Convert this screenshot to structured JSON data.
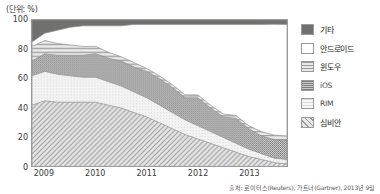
{
  "unit_label": "(단위: %)",
  "source_note": "출처: 로이터스(Reuters), 가트너(Gartner), 2013년 9월",
  "legend": {
    "items": [
      {
        "label": "기타",
        "swatch": "solid-dark-gray-swatch",
        "color": "#70706f"
      },
      {
        "label": "안드로이드",
        "swatch": "white-empty-swatch",
        "color": "#ffffff"
      },
      {
        "label": "윈도우",
        "swatch": "horizontal-lines-swatch",
        "color": "#c9c9c9"
      },
      {
        "label": "iOS",
        "swatch": "dense-dot-gray-swatch",
        "color": "#a3a3a3"
      },
      {
        "label": "RIM",
        "swatch": "light-dot-swatch",
        "color": "#efefef"
      },
      {
        "label": "심비안",
        "swatch": "diagonal-hatch-swatch",
        "color": "#cfcfcf"
      }
    ]
  },
  "chart_data": {
    "type": "area",
    "title": "",
    "xlabel": "",
    "ylabel": "",
    "unit": "%",
    "stacked": true,
    "normalized": true,
    "grid": true,
    "legend_position": "right",
    "ylim": [
      0,
      100
    ],
    "yticks": [
      0,
      20,
      40,
      60,
      80,
      100
    ],
    "xticks": [
      "2009",
      "2010",
      "2011",
      "2012",
      "2013"
    ],
    "xlim": [
      2008.75,
      2013.75
    ],
    "x": [
      2008.75,
      2009.0,
      2009.25,
      2009.5,
      2009.75,
      2010.0,
      2010.25,
      2010.5,
      2010.75,
      2011.0,
      2011.25,
      2011.5,
      2011.75,
      2012.0,
      2012.25,
      2012.5,
      2012.75,
      2013.0,
      2013.25,
      2013.5,
      2013.75
    ],
    "series": [
      {
        "name": "심비안",
        "stack_order": 1,
        "pattern": "diagonal-hatch",
        "color": "#cfcfcf",
        "values": [
          42,
          45,
          44,
          44,
          44,
          44,
          42,
          40,
          37,
          34,
          30,
          26,
          22,
          19,
          16,
          13,
          10,
          7,
          5,
          3,
          2
        ]
      },
      {
        "name": "RIM",
        "stack_order": 2,
        "pattern": "light-dots",
        "color": "#efefef",
        "values": [
          20,
          20,
          19,
          18,
          17,
          17,
          16,
          15,
          14,
          13,
          12,
          11,
          10,
          9,
          8,
          7,
          6,
          5,
          4,
          3,
          3
        ]
      },
      {
        "name": "iOS",
        "stack_order": 3,
        "pattern": "dense-dots",
        "color": "#a3a3a3",
        "values": [
          10,
          12,
          13,
          14,
          15,
          16,
          16,
          17,
          17,
          18,
          18,
          17,
          15,
          19,
          16,
          14,
          17,
          14,
          12,
          13,
          13
        ]
      },
      {
        "name": "윈도우",
        "stack_order": 4,
        "pattern": "horizontal-lines",
        "color": "#c9c9c9",
        "values": [
          10,
          9,
          8,
          7,
          6,
          5,
          4,
          3,
          3,
          2,
          2,
          2,
          2,
          2,
          2,
          2,
          2,
          2,
          3,
          3,
          3
        ]
      },
      {
        "name": "안드로이드",
        "stack_order": 5,
        "pattern": "none",
        "color": "#ffffff",
        "values": [
          3,
          5,
          9,
          12,
          14,
          14,
          18,
          21,
          26,
          30,
          35,
          41,
          48,
          48,
          55,
          61,
          62,
          69,
          73,
          77,
          76
        ]
      },
      {
        "name": "기타",
        "stack_order": 6,
        "pattern": "solid",
        "color": "#70706f",
        "values": [
          15,
          9,
          7,
          5,
          4,
          4,
          4,
          4,
          3,
          3,
          3,
          3,
          3,
          3,
          3,
          3,
          3,
          3,
          3,
          3,
          3
        ]
      }
    ]
  }
}
